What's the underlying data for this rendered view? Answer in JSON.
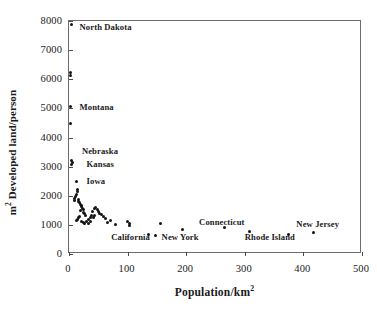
{
  "chart_data": {
    "type": "scatter",
    "title": "",
    "xlabel": "Population/km2",
    "ylabel": "m2 Developed land/person",
    "xlim": [
      0,
      500
    ],
    "ylim": [
      0,
      8000
    ],
    "xticks": [
      0,
      100,
      200,
      300,
      400,
      500
    ],
    "yticks": [
      0,
      1000,
      2000,
      3000,
      4000,
      5000,
      6000,
      7000,
      8000
    ],
    "xtick_labels": [
      "0",
      "100",
      "200",
      "300",
      "400",
      "500"
    ],
    "ytick_labels": [
      "0",
      "1000",
      "2000",
      "3000",
      "4000",
      "5000",
      "6000",
      "7000",
      "8000"
    ],
    "grid": false,
    "legend": "none",
    "marker": "dot",
    "marker_color": "#141414",
    "points": [
      {
        "x": 3.5,
        "y": 7870
      },
      {
        "x": 2.5,
        "y": 6230
      },
      {
        "x": 2.0,
        "y": 6120
      },
      {
        "x": 2.5,
        "y": 5060
      },
      {
        "x": 3.0,
        "y": 4480
      },
      {
        "x": 4.0,
        "y": 3200
      },
      {
        "x": 6.0,
        "y": 3140
      },
      {
        "x": 5.0,
        "y": 3060
      },
      {
        "x": 12.0,
        "y": 2480
      },
      {
        "x": 14.0,
        "y": 2230
      },
      {
        "x": 15.0,
        "y": 2150
      },
      {
        "x": 13.0,
        "y": 2040
      },
      {
        "x": 11.0,
        "y": 1960
      },
      {
        "x": 10.0,
        "y": 1900
      },
      {
        "x": 9.0,
        "y": 1850
      },
      {
        "x": 16.0,
        "y": 1880
      },
      {
        "x": 17.0,
        "y": 1800
      },
      {
        "x": 18.0,
        "y": 1760
      },
      {
        "x": 19.5,
        "y": 1700
      },
      {
        "x": 21.0,
        "y": 1650
      },
      {
        "x": 22.0,
        "y": 1620
      },
      {
        "x": 23.0,
        "y": 1560
      },
      {
        "x": 25.0,
        "y": 1520
      },
      {
        "x": 20.0,
        "y": 1480
      },
      {
        "x": 24.0,
        "y": 1430
      },
      {
        "x": 26.0,
        "y": 1380
      },
      {
        "x": 28.0,
        "y": 1330
      },
      {
        "x": 18.0,
        "y": 1290
      },
      {
        "x": 16.0,
        "y": 1240
      },
      {
        "x": 14.0,
        "y": 1200
      },
      {
        "x": 13.0,
        "y": 1150
      },
      {
        "x": 21.0,
        "y": 1120
      },
      {
        "x": 24.0,
        "y": 1080
      },
      {
        "x": 27.0,
        "y": 1060
      },
      {
        "x": 30.0,
        "y": 1120
      },
      {
        "x": 33.0,
        "y": 1180
      },
      {
        "x": 36.0,
        "y": 1250
      },
      {
        "x": 38.0,
        "y": 1320
      },
      {
        "x": 40.0,
        "y": 1470
      },
      {
        "x": 43.0,
        "y": 1560
      },
      {
        "x": 46.0,
        "y": 1600
      },
      {
        "x": 48.0,
        "y": 1520
      },
      {
        "x": 50.0,
        "y": 1450
      },
      {
        "x": 52.0,
        "y": 1380
      },
      {
        "x": 44.0,
        "y": 1330
      },
      {
        "x": 41.0,
        "y": 1260
      },
      {
        "x": 37.0,
        "y": 1100
      },
      {
        "x": 34.0,
        "y": 1060
      },
      {
        "x": 56.0,
        "y": 1340
      },
      {
        "x": 59.0,
        "y": 1290
      },
      {
        "x": 62.0,
        "y": 1220
      },
      {
        "x": 66.0,
        "y": 1080
      },
      {
        "x": 70.0,
        "y": 1150
      },
      {
        "x": 80.0,
        "y": 1000
      },
      {
        "x": 100.0,
        "y": 1120
      },
      {
        "x": 103.0,
        "y": 1060
      },
      {
        "x": 104.0,
        "y": 980
      },
      {
        "x": 136.0,
        "y": 660
      },
      {
        "x": 148.0,
        "y": 630
      },
      {
        "x": 156.0,
        "y": 1040
      },
      {
        "x": 193.0,
        "y": 840
      },
      {
        "x": 265.0,
        "y": 900
      },
      {
        "x": 308.0,
        "y": 780
      },
      {
        "x": 375.0,
        "y": 680
      },
      {
        "x": 418.0,
        "y": 730
      }
    ],
    "annotations": [
      {
        "text": "North Dakota",
        "x": 18,
        "y": 7760
      },
      {
        "text": "Montana",
        "x": 18,
        "y": 5020
      },
      {
        "text": "Nebraska",
        "x": 22,
        "y": 3500
      },
      {
        "text": "Kansas",
        "x": 30,
        "y": 3060
      },
      {
        "text": "Iowa",
        "x": 30,
        "y": 2470
      },
      {
        "text": "California",
        "x": 72,
        "y": 560
      },
      {
        "text": "New York",
        "x": 158,
        "y": 560
      },
      {
        "text": "Connecticut",
        "x": 222,
        "y": 1060
      },
      {
        "text": "Rhode Island",
        "x": 300,
        "y": 560
      },
      {
        "text": "New Jersey",
        "x": 388,
        "y": 1010
      }
    ]
  }
}
